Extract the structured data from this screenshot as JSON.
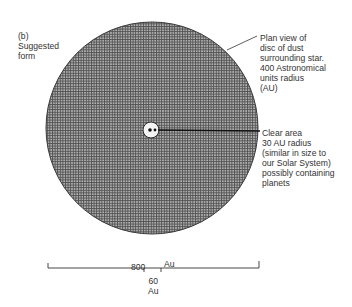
{
  "figure": {
    "label": "(b)\nSuggested\nform"
  },
  "annotations": {
    "disc": "Plan view of\ndisc of dust\nsurrounding star.\n400 Astronomical\nunits radius\n(AU)",
    "clear_area": "Clear area\n30 AU radius\n(similar in size to\nour Solar System)\npossibly containing\nplanets"
  },
  "scale_bar": {
    "main_value": "800",
    "main_unit": "Au",
    "inner_label": "60\nAu"
  },
  "colors": {
    "disc_fill": "#a8a8a8",
    "grid_line": "#555555",
    "outline": "#333333"
  }
}
